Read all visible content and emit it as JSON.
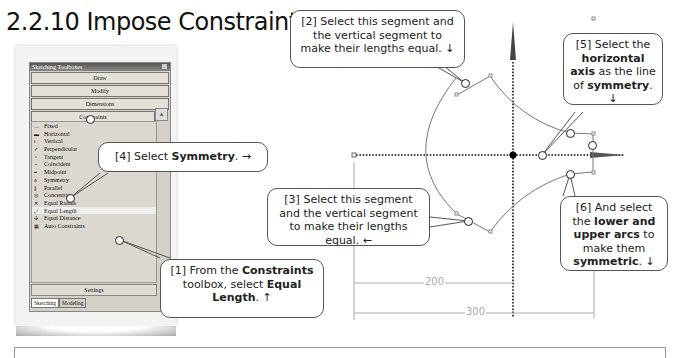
{
  "section_title": "2.2.10  Impose Constraints",
  "toolbox": {
    "title": "Sketching Toolboxes",
    "groups": [
      "Draw",
      "Modify",
      "Dimensions",
      "Constraints"
    ],
    "constraints_list": [
      {
        "label": "Fixed",
        "icon": "fixed-icon"
      },
      {
        "label": "Horizontal",
        "icon": "horizontal-icon"
      },
      {
        "label": "Vertical",
        "icon": "vertical-icon"
      },
      {
        "label": "Perpendicular",
        "icon": "perpendicular-icon"
      },
      {
        "label": "Tangent",
        "icon": "tangent-icon"
      },
      {
        "label": "Coincident",
        "icon": "coincident-icon"
      },
      {
        "label": "Midpoint",
        "icon": "midpoint-icon"
      },
      {
        "label": "Symmetry",
        "icon": "symmetry-icon"
      },
      {
        "label": "Parallel",
        "icon": "parallel-icon"
      },
      {
        "label": "Concentric",
        "icon": "concentric-icon"
      },
      {
        "label": "Equal Radius",
        "icon": "equal-radius-icon"
      },
      {
        "label": "Equal Length",
        "icon": "equal-length-icon",
        "selected": true
      },
      {
        "label": "Equal Distance",
        "icon": "equal-distance-icon"
      },
      {
        "label": "Auto Constraints",
        "icon": "auto-constraints-icon"
      }
    ],
    "settings_label": "Settings",
    "tabs": [
      "Sketching",
      "Modeling"
    ],
    "active_tab": "Sketching"
  },
  "callouts": {
    "c1": {
      "num": "[1]",
      "t1": " From the ",
      "b1": "Constraints",
      "t2": " toolbox, select ",
      "b2": "Equal Length",
      "t3": ". ↑"
    },
    "c2": {
      "num": "[2]",
      "text": " Select this segment and the vertical segment to make their lengths equal. ↓"
    },
    "c3": {
      "num": "[3]",
      "text": " Select this segment and the vertical segment to make their lengths equal. ←"
    },
    "c4": {
      "num": "[4]",
      "t1": " Select ",
      "b1": "Symmetry",
      "t2": ". →"
    },
    "c5": {
      "num": "[5]",
      "t1": " Select the ",
      "b1": "horizontal axis",
      "t2": " as the line of ",
      "b2": "symmetry",
      "t3": ". ↓"
    },
    "c6": {
      "num": "[6]",
      "t1": " And select the ",
      "b1": "lower and upper arcs",
      "t2": " to make them ",
      "b2": "symmetric",
      "t3": ". ↓"
    }
  },
  "dimensions": {
    "d1": "200",
    "d2": "300"
  }
}
